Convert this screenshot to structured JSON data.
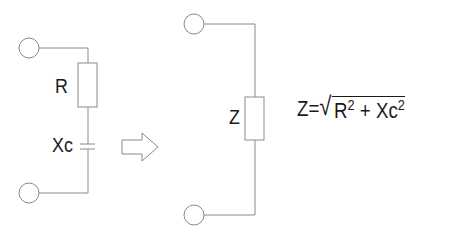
{
  "left_circuit": {
    "resistor_label": "R",
    "capacitor_label": "Xc"
  },
  "arrow": {
    "direction": "right"
  },
  "right_circuit": {
    "impedance_label": "Z"
  },
  "formula": {
    "lhs": "Z=",
    "sqrt_symbol": "√",
    "term1_base": "R",
    "term1_exp": "2",
    "operator": " + ",
    "term2_base": "Xc",
    "term2_exp": "2"
  },
  "colors": {
    "line": "#8a8a8a",
    "text": "#1a1a1a"
  }
}
